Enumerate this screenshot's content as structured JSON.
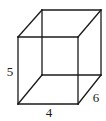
{
  "figure": {
    "type": "cube-wireframe",
    "stroke_color": "#1a1a1a",
    "background": "#ffffff",
    "vertices": {
      "front_top_left": [
        18,
        37
      ],
      "front_top_right": [
        78,
        37
      ],
      "front_bottom_left": [
        18,
        104
      ],
      "front_bottom_right": [
        78,
        104
      ],
      "back_top_left": [
        42,
        10
      ],
      "back_top_right": [
        101,
        10
      ],
      "back_bottom_left": [
        42,
        75
      ],
      "back_bottom_right": [
        101,
        75
      ]
    },
    "labels": {
      "height": {
        "text": "5",
        "x": 10,
        "y": 76
      },
      "width": {
        "text": "4",
        "x": 49,
        "y": 117
      },
      "depth": {
        "text": "6",
        "x": 96,
        "y": 102
      }
    }
  }
}
